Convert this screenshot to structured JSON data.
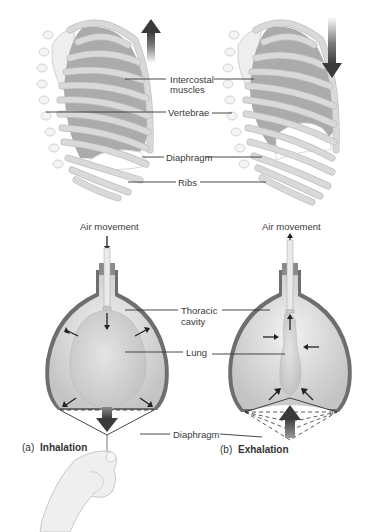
{
  "figure": {
    "top_labels": {
      "intercostal_line1": "Intercostal",
      "intercostal_line2": "muscles",
      "vertebrae": "Vertebrae",
      "diaphragm": "Diaphragm",
      "ribs": "Ribs"
    },
    "bottom_labels": {
      "air_movement_left": "Air movement",
      "air_movement_right": "Air movement",
      "thoracic_line1": "Thoracic",
      "thoracic_line2": "cavity",
      "lung": "Lung",
      "diaphragm": "Diaphragm"
    },
    "captions": {
      "a_prefix": "(a)",
      "a_title": "Inhalation",
      "b_prefix": "(b)",
      "b_title": "Exhalation"
    },
    "arrows": {
      "ribcage_left_direction": "up",
      "ribcage_right_direction": "down",
      "air_left_direction": "in",
      "air_right_direction": "out"
    },
    "colors": {
      "muscle_gray": "#a9a9a9",
      "rib_white": "#f2f2f2",
      "jar_wall": "#6e6e6e",
      "lung_fill": "#d6d6d6",
      "arrow_dark": "#3c3c3c"
    }
  }
}
